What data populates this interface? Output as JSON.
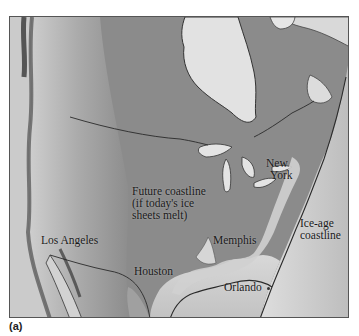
{
  "figure": {
    "panel_label": "(a)",
    "map_type": "shaded relief map of North America (grayscale)"
  },
  "labels": {
    "future_coastline": {
      "line1": "Future coastline",
      "line2": "(if today's ice",
      "line3": "sheets melt)"
    },
    "ice_age_coastline": {
      "line1": "Ice-age",
      "line2": "coastline"
    },
    "cities": {
      "los_angeles": "Los Angeles",
      "houston": "Houston",
      "memphis": "Memphis",
      "orlando": "Orlando",
      "new_york_line1": "New",
      "new_york_line2": "York"
    }
  },
  "colors": {
    "land": "#8a8a8a",
    "mountains": "#b5b5b5",
    "ocean_shelf": "#d6d6d6",
    "deep_ocean": "#c4c4c4",
    "ice_sheet_water": "#e6e6e6",
    "lines": "#2a2a2a"
  }
}
